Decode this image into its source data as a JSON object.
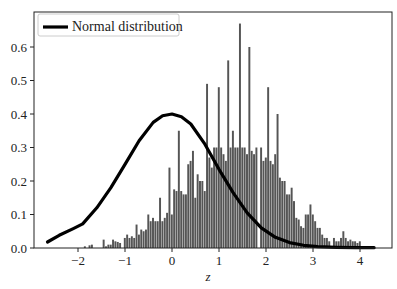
{
  "chart_data": {
    "type": "bar",
    "title": "",
    "xlabel": "z",
    "ylabel": "",
    "xlim": [
      -2.9,
      4.7
    ],
    "ylim": [
      0.0,
      0.67
    ],
    "grid": false,
    "legend": {
      "position": "upper left",
      "entries": [
        "Normal distribution"
      ]
    },
    "x_ticks": [
      "−2",
      "−1",
      "0",
      "1",
      "2",
      "3",
      "4"
    ],
    "x_tick_values": [
      -2,
      -1,
      0,
      1,
      2,
      3,
      4
    ],
    "y_ticks": [
      "0.0",
      "0.1",
      "0.2",
      "0.3",
      "0.4",
      "0.5",
      "0.6"
    ],
    "y_tick_values": [
      0.0,
      0.1,
      0.2,
      0.3,
      0.4,
      0.5,
      0.6
    ],
    "series": [
      {
        "name": "Histogram",
        "kind": "bar",
        "color": "#555555",
        "bin_width": 0.05,
        "bins": [
          [
            -1.85,
            0.005
          ],
          [
            -1.75,
            0.008
          ],
          [
            -1.7,
            0.01
          ],
          [
            -1.45,
            0.025
          ],
          [
            -1.4,
            0.005
          ],
          [
            -1.35,
            0.01
          ],
          [
            -1.3,
            0.01
          ],
          [
            -1.25,
            0.025
          ],
          [
            -1.2,
            0.02
          ],
          [
            -1.15,
            0.018
          ],
          [
            -1.1,
            0.015
          ],
          [
            -1.0,
            0.03
          ],
          [
            -0.95,
            0.04
          ],
          [
            -0.9,
            0.03
          ],
          [
            -0.85,
            0.035
          ],
          [
            -0.8,
            0.03
          ],
          [
            -0.75,
            0.07
          ],
          [
            -0.7,
            0.04
          ],
          [
            -0.65,
            0.055
          ],
          [
            -0.6,
            0.05
          ],
          [
            -0.55,
            0.055
          ],
          [
            -0.5,
            0.1
          ],
          [
            -0.45,
            0.08
          ],
          [
            -0.4,
            0.09
          ],
          [
            -0.35,
            0.08
          ],
          [
            -0.3,
            0.08
          ],
          [
            -0.25,
            0.15
          ],
          [
            -0.2,
            0.08
          ],
          [
            -0.15,
            0.09
          ],
          [
            -0.1,
            0.105
          ],
          [
            -0.05,
            0.24
          ],
          [
            0.0,
            0.1
          ],
          [
            0.05,
            0.175
          ],
          [
            0.1,
            0.17
          ],
          [
            0.15,
            0.35
          ],
          [
            0.2,
            0.17
          ],
          [
            0.25,
            0.16
          ],
          [
            0.3,
            0.16
          ],
          [
            0.35,
            0.25
          ],
          [
            0.4,
            0.26
          ],
          [
            0.45,
            0.29
          ],
          [
            0.5,
            0.15
          ],
          [
            0.55,
            0.22
          ],
          [
            0.6,
            0.2
          ],
          [
            0.65,
            0.2
          ],
          [
            0.7,
            0.17
          ],
          [
            0.75,
            0.49
          ],
          [
            0.8,
            0.27
          ],
          [
            0.85,
            0.24
          ],
          [
            0.9,
            0.3
          ],
          [
            0.95,
            0.3
          ],
          [
            1.0,
            0.48
          ],
          [
            1.05,
            0.3
          ],
          [
            1.1,
            0.28
          ],
          [
            1.15,
            0.26
          ],
          [
            1.2,
            0.56
          ],
          [
            1.25,
            0.3
          ],
          [
            1.3,
            0.35
          ],
          [
            1.35,
            0.3
          ],
          [
            1.4,
            0.3
          ],
          [
            1.45,
            0.67
          ],
          [
            1.5,
            0.3
          ],
          [
            1.55,
            0.3
          ],
          [
            1.6,
            0.28
          ],
          [
            1.65,
            0.6
          ],
          [
            1.7,
            0.29
          ],
          [
            1.75,
            0.28
          ],
          [
            1.8,
            0.3
          ],
          [
            1.9,
            0.3
          ],
          [
            1.95,
            0.26
          ],
          [
            2.0,
            0.27
          ],
          [
            2.05,
            0.48
          ],
          [
            2.1,
            0.26
          ],
          [
            2.15,
            0.25
          ],
          [
            2.2,
            0.28
          ],
          [
            2.25,
            0.4
          ],
          [
            2.3,
            0.21
          ],
          [
            2.35,
            0.2
          ],
          [
            2.4,
            0.2
          ],
          [
            2.45,
            0.16
          ],
          [
            2.5,
            0.16
          ],
          [
            2.55,
            0.18
          ],
          [
            2.6,
            0.14
          ],
          [
            2.65,
            0.09
          ],
          [
            2.7,
            0.085
          ],
          [
            2.75,
            0.065
          ],
          [
            2.8,
            0.06
          ],
          [
            2.85,
            0.1
          ],
          [
            2.9,
            0.1
          ],
          [
            2.95,
            0.13
          ],
          [
            3.0,
            0.1
          ],
          [
            3.05,
            0.08
          ],
          [
            3.1,
            0.06
          ],
          [
            3.15,
            0.06
          ],
          [
            3.2,
            0.04
          ],
          [
            3.25,
            0.03
          ],
          [
            3.3,
            0.03
          ],
          [
            3.35,
            0.02
          ],
          [
            3.45,
            0.03
          ],
          [
            3.5,
            0.02
          ],
          [
            3.55,
            0.02
          ],
          [
            3.6,
            0.03
          ],
          [
            3.65,
            0.05
          ],
          [
            3.7,
            0.03
          ],
          [
            3.75,
            0.02
          ],
          [
            3.8,
            0.025
          ],
          [
            3.85,
            0.02
          ],
          [
            3.9,
            0.02
          ],
          [
            3.95,
            0.015
          ],
          [
            4.0,
            0.02
          ]
        ]
      },
      {
        "name": "Normal distribution",
        "kind": "line",
        "color": "#000000",
        "x": [
          -2.65,
          -2.4,
          -2.1,
          -1.9,
          -1.6,
          -1.3,
          -1.0,
          -0.7,
          -0.4,
          -0.2,
          0.0,
          0.2,
          0.4,
          0.7,
          1.0,
          1.3,
          1.6,
          1.9,
          2.2,
          2.5,
          2.8,
          3.1,
          3.5,
          3.9,
          4.3
        ],
        "values": [
          0.018,
          0.038,
          0.058,
          0.072,
          0.12,
          0.18,
          0.25,
          0.32,
          0.375,
          0.395,
          0.4,
          0.392,
          0.37,
          0.31,
          0.235,
          0.165,
          0.105,
          0.06,
          0.032,
          0.016,
          0.008,
          0.004,
          0.002,
          0.001,
          0.001
        ]
      }
    ]
  }
}
